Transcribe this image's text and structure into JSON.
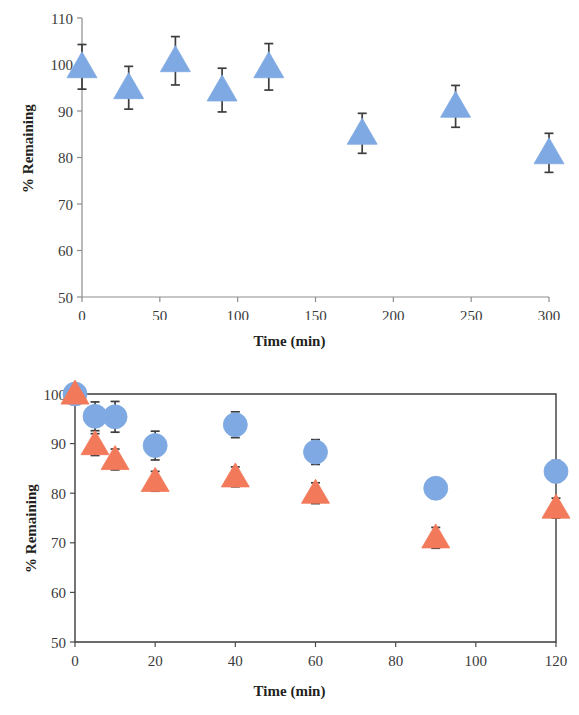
{
  "figures": {
    "top": {
      "name": "stability-300min-single-series",
      "ylabel": "% Remaining",
      "xlabel": "Time (min)"
    },
    "bottom": {
      "name": "stability-120min-two-series",
      "ylabel": "% Remaining",
      "xlabel": "Time (min)"
    }
  },
  "colors": {
    "blue_marker": "#7FA9E2",
    "blue_marker_edge": "#6E9BDA",
    "orange_marker": "#F2795A",
    "orange_marker_edge": "#E86A4C",
    "error_bar": "#3d3d3d",
    "axis": "#8d8d8d",
    "axis_dark": "#3b3b3b",
    "tick_label": "#3a3a3a",
    "axis_title": "#231f20"
  },
  "chart_data": [
    {
      "id": "top",
      "type": "scatter",
      "title": "",
      "xlabel": "Time (min)",
      "ylabel": "% Remaining",
      "xlim": [
        0,
        300
      ],
      "ylim": [
        50,
        110
      ],
      "xticks": [
        0,
        50,
        100,
        150,
        200,
        250,
        300
      ],
      "yticks": [
        50,
        60,
        70,
        80,
        90,
        100,
        110
      ],
      "xtick_labels": [
        "0",
        "50",
        "100",
        "150",
        "200",
        "250",
        "300"
      ],
      "ytick_labels": [
        "50",
        "60",
        "70",
        "80",
        "90",
        "100",
        "110"
      ],
      "grid": false,
      "legend": false,
      "frame": "left-bottom",
      "series": [
        {
          "name": "series-1",
          "marker": "triangle",
          "color": "#7FA9E2",
          "x": [
            0,
            30,
            60,
            90,
            120,
            180,
            240,
            300
          ],
          "values": [
            99.5,
            95.0,
            100.8,
            94.5,
            99.5,
            85.2,
            91.0,
            81.0
          ],
          "yerr": [
            4.8,
            4.6,
            5.2,
            4.7,
            5.0,
            4.3,
            4.5,
            4.2
          ]
        }
      ]
    },
    {
      "id": "bottom",
      "type": "scatter",
      "title": "",
      "xlabel": "Time (min)",
      "ylabel": "% Remaining",
      "xlim": [
        0,
        120
      ],
      "ylim": [
        50,
        100
      ],
      "xticks": [
        0,
        20,
        40,
        60,
        80,
        100,
        120
      ],
      "yticks": [
        50,
        60,
        70,
        80,
        90,
        100
      ],
      "xtick_labels": [
        "0",
        "20",
        "40",
        "60",
        "80",
        "100",
        "120"
      ],
      "ytick_labels": [
        "50",
        "60",
        "70",
        "80",
        "90",
        "100"
      ],
      "grid": false,
      "legend": false,
      "frame": "box",
      "series": [
        {
          "name": "series-circles",
          "marker": "circle",
          "color": "#7FA9E2",
          "x": [
            0,
            5,
            10,
            20,
            40,
            60,
            90,
            120
          ],
          "values": [
            100.0,
            95.5,
            95.4,
            89.6,
            93.8,
            88.3,
            81.0,
            84.4
          ],
          "yerr": [
            0.6,
            2.9,
            3.1,
            2.9,
            2.6,
            2.5,
            2.1,
            2.2
          ]
        },
        {
          "name": "series-triangles",
          "marker": "triangle",
          "color": "#F2795A",
          "x": [
            0,
            5,
            10,
            20,
            40,
            60,
            90,
            120
          ],
          "values": [
            100.0,
            89.8,
            86.8,
            82.4,
            83.3,
            80.0,
            71.0,
            77.0
          ],
          "yerr": [
            0.6,
            2.2,
            2.1,
            2.0,
            2.0,
            2.1,
            2.1,
            2.0
          ]
        }
      ]
    }
  ]
}
